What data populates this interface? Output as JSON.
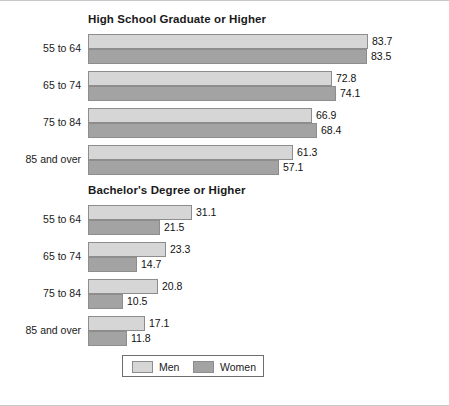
{
  "chart_data": [
    {
      "type": "bar",
      "title": "High School Graduate or Higher",
      "orientation": "horizontal",
      "xlabel": "",
      "ylabel": "",
      "grid": false,
      "xlim": [
        0,
        83.7
      ],
      "categories": [
        "55 to 64",
        "65 to 74",
        "75 to 84",
        "85 and over"
      ],
      "series": [
        {
          "name": "Men",
          "color": "#d6d6d6",
          "values": [
            83.7,
            72.8,
            66.9,
            61.3
          ]
        },
        {
          "name": "Women",
          "color": "#a3a3a3",
          "values": [
            83.5,
            74.1,
            68.4,
            57.1
          ]
        }
      ]
    },
    {
      "type": "bar",
      "title": "Bachelor's Degree or Higher",
      "orientation": "horizontal",
      "xlabel": "",
      "ylabel": "",
      "grid": false,
      "xlim": [
        0,
        83.7
      ],
      "categories": [
        "55 to 64",
        "65 to 74",
        "75 to 84",
        "85 and over"
      ],
      "series": [
        {
          "name": "Men",
          "color": "#d6d6d6",
          "values": [
            31.1,
            23.3,
            20.8,
            17.1
          ]
        },
        {
          "name": "Women",
          "color": "#a3a3a3",
          "values": [
            21.5,
            14.7,
            10.5,
            11.8
          ]
        }
      ]
    }
  ],
  "legend": {
    "position": "bottom-center",
    "entries": [
      {
        "label": "Men",
        "color": "#d6d6d6"
      },
      {
        "label": "Women",
        "color": "#a3a3a3"
      }
    ]
  },
  "panels": {
    "high_school": {
      "title": "High School Graduate or Higher",
      "categories": [
        "55 to 64",
        "65 to 74",
        "75 to 84",
        "85 and over"
      ],
      "men": [
        "83.7",
        "72.8",
        "66.9",
        "61.3"
      ],
      "women": [
        "83.5",
        "74.1",
        "68.4",
        "57.1"
      ]
    },
    "bachelors": {
      "title": "Bachelor's Degree or Higher",
      "categories": [
        "55 to 64",
        "65 to 74",
        "75 to 84",
        "85 and over"
      ],
      "men": [
        "31.1",
        "23.3",
        "20.8",
        "17.1"
      ],
      "women": [
        "21.5",
        "14.7",
        "10.5",
        "11.8"
      ]
    }
  }
}
